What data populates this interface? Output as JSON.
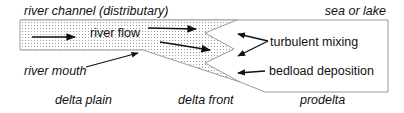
{
  "diagram": {
    "colors": {
      "line": "#222222",
      "outline": "#9a9a9a",
      "stipple_dot": "#8c8c8c",
      "background": "#ffffff"
    },
    "labels": {
      "river_channel": "river channel (distributary)",
      "sea_or_lake": "sea or lake",
      "river_flow": "river flow",
      "turbulent_mixing": "turbulent mixing",
      "river_mouth": "river mouth",
      "bedload_deposition": "bedload deposition",
      "delta_plain": "delta plain",
      "delta_front": "delta front",
      "prodelta": "prodelta"
    },
    "icons": {
      "flow_arrows": "arrow-right-icon",
      "mixing_arrows": "arrow-left-icon",
      "pointer_line": "leader-line-icon"
    }
  }
}
